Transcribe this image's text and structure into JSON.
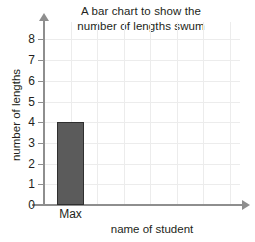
{
  "chart_data": {
    "type": "bar",
    "title": "A bar chart to show the number of lengths swum",
    "title_lines": [
      "A bar chart to show the",
      "number of lengths swum"
    ],
    "categories": [
      "Max"
    ],
    "values": [
      4
    ],
    "xlabel": "name of student",
    "ylabel": "number of lengths",
    "ylim": [
      0,
      8
    ],
    "ytick_labels": [
      "0",
      "1",
      "2",
      "3",
      "4",
      "5",
      "6",
      "7",
      "8"
    ],
    "ytick_values": [
      0,
      1,
      2,
      3,
      4,
      5,
      6,
      7,
      8
    ],
    "grid": true,
    "legend": null,
    "bar_color": "#5b5b5b",
    "bar_edge_color": "#2f2f2f",
    "grid_color": "#ececec",
    "axis_color": "#8e8e8e",
    "text_color": "#231f20"
  }
}
